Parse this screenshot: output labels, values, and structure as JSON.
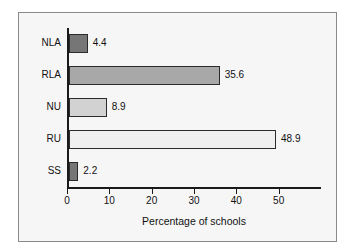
{
  "figure": {
    "background_color": "#f6f6f6",
    "border_color": "#8a8a8a",
    "axis_color": "#1a1a1a"
  },
  "chart_data": {
    "type": "bar",
    "orientation": "horizontal",
    "title": "",
    "subtitle": "",
    "xlabel": "Percentage of schools",
    "ylabel": "",
    "categories": [
      "NLA",
      "RLA",
      "NU",
      "RU",
      "SS"
    ],
    "values": [
      4.4,
      35.6,
      8.9,
      48.9,
      2.2
    ],
    "value_labels": [
      "4.4",
      "35.6",
      "8.9",
      "48.9",
      "2.2"
    ],
    "bar_colors": [
      "#767676",
      "#a8a8a8",
      "#d2d2d2",
      "#f0f0f0",
      "#767676"
    ],
    "bar_edge_color": "#2b2b2b",
    "xlim": [
      0,
      60
    ],
    "xticks": [
      0,
      10,
      20,
      30,
      40,
      50
    ],
    "xtick_labels": [
      "0",
      "10",
      "20",
      "30",
      "40",
      "50"
    ],
    "grid": false,
    "legend": false,
    "legend_position": "none"
  }
}
